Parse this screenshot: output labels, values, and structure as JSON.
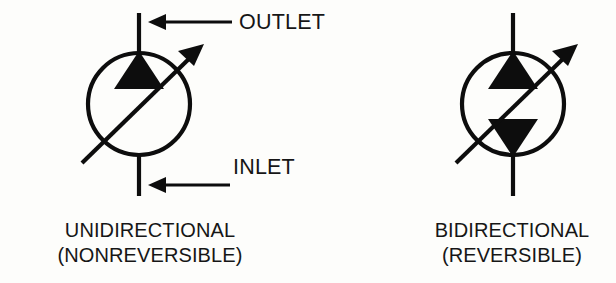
{
  "figure": {
    "background_color": "#fdfdfb",
    "ink_color": "#0d0d0d",
    "symbols": [
      {
        "id": "unidirectional-pump",
        "caption_line1": "UNIDIRECTIONAL",
        "caption_line2": "(NONREVERSIBLE)",
        "caption_center_x": 150,
        "caption_line1_y": 237,
        "caption_line2_y": 262,
        "circle": {
          "cx": 139,
          "cy": 104,
          "r": 51,
          "stroke_width": 4.2
        },
        "triangles": [
          {
            "name": "outlet-triangle",
            "direction": "up",
            "points": "139,51 164,89 114,89"
          }
        ],
        "diagonal_arrow": {
          "x1": 82,
          "y1": 163,
          "x2": 198,
          "y2": 50,
          "stroke_width": 4.2,
          "head_points": "203,45 180,52 192,63"
        },
        "port_lines": [
          {
            "name": "outlet-port-line",
            "x1": 139,
            "y1": 13,
            "x2": 139,
            "y2": 53,
            "stroke_width": 4.2
          },
          {
            "name": "inlet-port-line",
            "x1": 139,
            "y1": 155,
            "x2": 139,
            "y2": 196,
            "stroke_width": 4.2
          }
        ],
        "flow_arrows": [
          {
            "name": "outlet-flow-arrow",
            "label": "OUTLET",
            "shaft_x1": 232,
            "shaft_x2": 160,
            "y": 22,
            "head_points": "148,22 164,15 164,29",
            "label_x": 239,
            "label_y": 29
          },
          {
            "name": "inlet-flow-arrow",
            "label": "INLET",
            "shaft_x1": 230,
            "shaft_x2": 160,
            "y": 185,
            "head_points": "148,185 164,178 164,192",
            "label_x": 233,
            "label_y": 174
          }
        ]
      },
      {
        "id": "bidirectional-pump",
        "caption_line1": "BIDIRECTIONAL",
        "caption_line2": "(REVERSIBLE)",
        "caption_center_x": 512,
        "caption_line1_y": 237,
        "caption_line2_y": 262,
        "circle": {
          "cx": 513,
          "cy": 104,
          "r": 51,
          "stroke_width": 4.2
        },
        "triangles": [
          {
            "name": "top-triangle",
            "direction": "up",
            "points": "513,51 538,89 488,89"
          },
          {
            "name": "bottom-triangle",
            "direction": "down",
            "points": "513,157 538,119 488,119"
          }
        ],
        "diagonal_arrow": {
          "x1": 456,
          "y1": 163,
          "x2": 572,
          "y2": 50,
          "stroke_width": 4.2,
          "head_points": "577,45 554,52 566,63"
        },
        "port_lines": [
          {
            "name": "top-port-line",
            "x1": 513,
            "y1": 13,
            "x2": 513,
            "y2": 53,
            "stroke_width": 4.2
          },
          {
            "name": "bottom-port-line",
            "x1": 513,
            "y1": 155,
            "x2": 513,
            "y2": 196,
            "stroke_width": 4.2
          }
        ],
        "flow_arrows": []
      }
    ]
  }
}
